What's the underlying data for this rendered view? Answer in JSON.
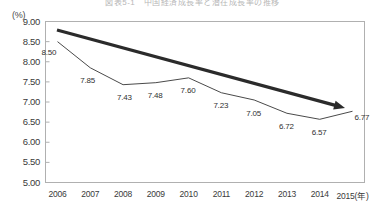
{
  "chart_data": {
    "type": "line",
    "title": "図表5-1　中国経済成長率と潜在成長率の推移",
    "ylabel": "(%)",
    "xlabel": "(年)",
    "x_axis_suffix_label": "2015(年)",
    "categories": [
      "2006",
      "2007",
      "2008",
      "2009",
      "2010",
      "2011",
      "2012",
      "2013",
      "2014",
      "2015"
    ],
    "values": [
      8.5,
      7.85,
      7.43,
      7.48,
      7.6,
      7.23,
      7.05,
      6.72,
      6.57,
      6.77
    ],
    "point_labels": [
      "8.50",
      "7.85",
      "7.43",
      "7.48",
      "7.60",
      "7.23",
      "7.05",
      "6.72",
      "6.57",
      "6.77"
    ],
    "ylim": [
      5.0,
      9.0
    ],
    "ytick_labels": [
      "9.00",
      "8.50",
      "8.00",
      "7.50",
      "7.00",
      "6.50",
      "6.00",
      "5.50",
      "5.00"
    ],
    "ytick_values": [
      9.0,
      8.5,
      8.0,
      7.5,
      7.0,
      6.5,
      6.0,
      5.5,
      5.0
    ],
    "grid": false,
    "legend": "none",
    "series": [
      {
        "name": "data-line",
        "values": [
          8.5,
          7.85,
          7.43,
          7.48,
          7.6,
          7.23,
          7.05,
          6.72,
          6.57,
          6.77
        ],
        "color": "#4a4a4a",
        "width": 1
      },
      {
        "name": "trend-arrow",
        "start": [
          2006,
          8.8
        ],
        "end": [
          2014.6,
          6.96
        ],
        "color": "#2b2b2b",
        "width": 3,
        "arrowhead": true
      }
    ],
    "colors": {
      "frame": "#b0b0b0",
      "text": "#3a3a3a",
      "data_line": "#4a4a4a",
      "trend_arrow": "#2b2b2b",
      "background": "#ffffff"
    }
  }
}
